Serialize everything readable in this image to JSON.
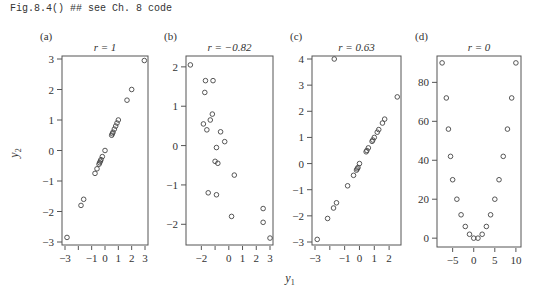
{
  "code_line": "Fig.8.4() ## see Ch. 8 code",
  "shared_xlabel": "y1",
  "shared_ylabel": "y2",
  "chart_data": [
    {
      "type": "scatter",
      "panel_label": "(a)",
      "title": "r = 1",
      "xlabel": "y1",
      "ylabel": "y2",
      "xlim": [
        -3,
        3
      ],
      "ylim": [
        -3,
        3
      ],
      "xticks": [
        -3,
        -1,
        0,
        1,
        2,
        3
      ],
      "xticks_minor": [
        -2
      ],
      "yticks": [
        -3,
        -2,
        -1,
        0,
        1,
        2,
        3
      ],
      "grid": false,
      "points": [
        [
          -2.85,
          -2.85
        ],
        [
          -1.8,
          -1.8
        ],
        [
          -1.6,
          -1.6
        ],
        [
          -0.75,
          -0.75
        ],
        [
          -0.6,
          -0.6
        ],
        [
          -0.45,
          -0.45
        ],
        [
          -0.4,
          -0.4
        ],
        [
          -0.35,
          -0.35
        ],
        [
          -0.3,
          -0.3
        ],
        [
          -0.2,
          -0.2
        ],
        [
          0.0,
          0.0
        ],
        [
          0.5,
          0.5
        ],
        [
          0.55,
          0.55
        ],
        [
          0.6,
          0.6
        ],
        [
          0.7,
          0.7
        ],
        [
          0.8,
          0.8
        ],
        [
          0.9,
          0.9
        ],
        [
          1.0,
          1.0
        ],
        [
          1.65,
          1.65
        ],
        [
          2.0,
          2.0
        ],
        [
          2.95,
          2.95
        ]
      ]
    },
    {
      "type": "scatter",
      "panel_label": "(b)",
      "title": "r = −0.82",
      "xlabel": "y1",
      "ylabel": "y2",
      "xlim": [
        -2.9,
        3.0
      ],
      "ylim": [
        -2.45,
        2.2
      ],
      "xticks": [
        -2,
        0,
        1,
        2,
        3
      ],
      "xticks_minor": [
        -1
      ],
      "yticks": [
        -2,
        -1,
        0,
        1,
        2
      ],
      "grid": false,
      "points": [
        [
          -2.8,
          2.05
        ],
        [
          -1.7,
          1.65
        ],
        [
          -1.15,
          1.65
        ],
        [
          -1.75,
          1.35
        ],
        [
          -1.2,
          0.8
        ],
        [
          -1.35,
          0.65
        ],
        [
          -1.85,
          0.55
        ],
        [
          -1.6,
          0.4
        ],
        [
          -0.6,
          0.35
        ],
        [
          -0.3,
          0.1
        ],
        [
          -0.9,
          -0.05
        ],
        [
          -1.0,
          -0.4
        ],
        [
          -0.8,
          -0.45
        ],
        [
          0.4,
          -0.75
        ],
        [
          -1.5,
          -1.2
        ],
        [
          -0.9,
          -1.25
        ],
        [
          0.2,
          -1.8
        ],
        [
          2.5,
          -1.6
        ],
        [
          2.5,
          -1.95
        ],
        [
          3.0,
          -2.35
        ]
      ]
    },
    {
      "type": "scatter",
      "panel_label": "(c)",
      "title": "r = 0.63",
      "xlabel": "y1",
      "ylabel": "y2",
      "xlim": [
        -3,
        2.6
      ],
      "ylim": [
        -3,
        4
      ],
      "xticks": [
        -3,
        -1,
        0,
        1,
        2
      ],
      "xticks_minor": [
        -2
      ],
      "yticks": [
        -3,
        -2,
        -1,
        0,
        1,
        2,
        3,
        4
      ],
      "grid": false,
      "points": [
        [
          -2.85,
          -2.9
        ],
        [
          -2.15,
          -2.1
        ],
        [
          -1.75,
          -1.7
        ],
        [
          -1.55,
          -1.5
        ],
        [
          -0.8,
          -0.85
        ],
        [
          -0.4,
          -0.45
        ],
        [
          -0.2,
          -0.25
        ],
        [
          -0.15,
          -0.2
        ],
        [
          -0.1,
          -0.15
        ],
        [
          0.0,
          0.0
        ],
        [
          0.45,
          0.45
        ],
        [
          0.5,
          0.5
        ],
        [
          0.6,
          0.6
        ],
        [
          0.85,
          0.85
        ],
        [
          0.9,
          0.9
        ],
        [
          1.0,
          1.0
        ],
        [
          1.2,
          1.2
        ],
        [
          1.3,
          1.3
        ],
        [
          1.55,
          1.55
        ],
        [
          1.7,
          1.7
        ],
        [
          2.55,
          2.55
        ],
        [
          -1.7,
          4.0
        ]
      ]
    },
    {
      "type": "scatter",
      "panel_label": "(d)",
      "title": "r = 0",
      "xlabel": "y1",
      "ylabel": "y2",
      "xlim": [
        -8,
        10.5
      ],
      "ylim": [
        -3,
        92
      ],
      "xticks": [
        -5,
        0,
        5,
        10
      ],
      "yticks": [
        0,
        20,
        40,
        60,
        80
      ],
      "grid": false,
      "points": [
        [
          -7.5,
          90
        ],
        [
          -6.5,
          72
        ],
        [
          -6,
          56
        ],
        [
          -5.5,
          42
        ],
        [
          -5,
          30
        ],
        [
          -4,
          20
        ],
        [
          -3,
          12
        ],
        [
          -2,
          6
        ],
        [
          -1,
          2
        ],
        [
          0,
          0
        ],
        [
          1,
          0
        ],
        [
          2,
          2
        ],
        [
          3,
          6
        ],
        [
          4,
          12
        ],
        [
          5,
          20
        ],
        [
          6,
          30
        ],
        [
          7,
          42
        ],
        [
          8,
          56
        ],
        [
          9,
          72
        ],
        [
          10,
          90
        ]
      ]
    }
  ],
  "layout": {
    "panels": [
      {
        "left": 62,
        "top": 56,
        "right": 148,
        "bottom": 245
      },
      {
        "left": 186,
        "top": 56,
        "right": 273,
        "bottom": 245
      },
      {
        "left": 312,
        "top": 56,
        "right": 401,
        "bottom": 245
      },
      {
        "left": 437,
        "top": 56,
        "right": 521,
        "bottom": 247
      }
    ],
    "colors": {
      "axis": "#555555",
      "point": "#444444",
      "text": "#333333"
    }
  }
}
